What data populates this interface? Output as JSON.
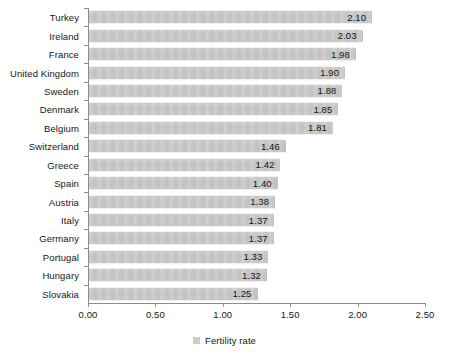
{
  "chart_data": {
    "type": "bar",
    "orientation": "horizontal",
    "title": "",
    "xlabel": "",
    "ylabel": "",
    "xlim": [
      0.0,
      2.5
    ],
    "xticks": [
      "0.00",
      "0.50",
      "1.00",
      "1.50",
      "2.00",
      "2.50"
    ],
    "xtick_values": [
      0.0,
      0.5,
      1.0,
      1.5,
      2.0,
      2.5
    ],
    "grid": false,
    "legend": {
      "position": "bottom-center",
      "entries": [
        {
          "label": "Fertility rate",
          "color": "#cbcbcb"
        }
      ]
    },
    "series": [
      {
        "name": "Fertility rate",
        "color": "#cbcbcb",
        "categories": [
          "Turkey",
          "Ireland",
          "France",
          "United Kingdom",
          "Sweden",
          "Denmark",
          "Belgium",
          "Switzerland",
          "Greece",
          "Spain",
          "Austria",
          "Italy",
          "Germany",
          "Portugal",
          "Hungary",
          "Slovakia"
        ],
        "values": [
          2.1,
          2.03,
          1.98,
          1.9,
          1.88,
          1.85,
          1.81,
          1.46,
          1.42,
          1.4,
          1.38,
          1.37,
          1.37,
          1.33,
          1.32,
          1.25
        ],
        "labels": [
          "2.10",
          "2.03",
          "1.98",
          "1.90",
          "1.88",
          "1.85",
          "1.81",
          "1.46",
          "1.42",
          "1.40",
          "1.38",
          "1.37",
          "1.37",
          "1.33",
          "1.32",
          "1.25"
        ]
      }
    ]
  }
}
